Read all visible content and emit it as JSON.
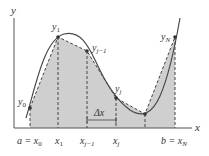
{
  "diagram": {
    "axes": {
      "x_label": "x",
      "y_label": "y"
    },
    "colors": {
      "curve": "#4a4a4a",
      "shade": "#cfcfcf",
      "axis": "#555555",
      "dash": "#444444",
      "point": "#333333"
    },
    "point_labels": {
      "y0": "y",
      "y0_sub": "0",
      "y1": "y",
      "y1_sub": "1",
      "yjm1": "y",
      "yjm1_sub": "j−1",
      "yj": "y",
      "yj_sub": "j",
      "yN": "y",
      "yN_sub": "N"
    },
    "tick_labels": {
      "a_eq": "a = x",
      "a_sub": "0",
      "x1": "x",
      "x1_sub": "1",
      "xjm1": "x",
      "xjm1_sub": "j−1",
      "xj": "x",
      "xj_sub": "j",
      "b_eq": "b = x",
      "b_sub": "N"
    },
    "delta_label": "Δx"
  }
}
